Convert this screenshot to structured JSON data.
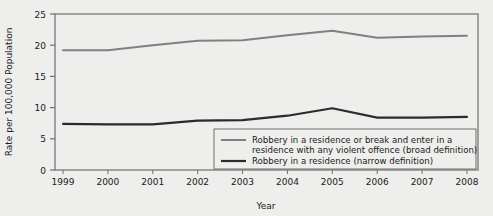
{
  "chart_data": {
    "type": "line",
    "title": "",
    "xlabel": "Year",
    "ylabel": "Rate per 100,000 Population",
    "categories": [
      "1999",
      "2000",
      "2001",
      "2002",
      "2003",
      "2004",
      "2005",
      "2006",
      "2007",
      "2008"
    ],
    "x": [
      1999,
      2000,
      2001,
      2002,
      2003,
      2004,
      2005,
      2006,
      2007,
      2008
    ],
    "xlim": [
      1999,
      2008
    ],
    "ylim": [
      0,
      25
    ],
    "yticks": [
      0,
      5,
      10,
      15,
      20,
      25
    ],
    "ytick_labels": [
      "0",
      "5",
      "10",
      "15",
      "20",
      "25"
    ],
    "grid": false,
    "legend_position": "lower right",
    "series": [
      {
        "name": "Robbery in a residence or break and enter in a residence with any violent offence (broad definition)",
        "color": "#808080",
        "values": [
          19.2,
          19.2,
          20.0,
          20.7,
          20.8,
          21.6,
          22.3,
          21.2,
          21.4,
          21.5
        ]
      },
      {
        "name": "Robbery in a residence (narrow definition)",
        "color": "#2b2b2b",
        "values": [
          7.4,
          7.3,
          7.3,
          7.9,
          8.0,
          8.7,
          9.9,
          8.4,
          8.4,
          8.5
        ]
      }
    ]
  },
  "legend": {
    "items": [
      {
        "line1": "Robbery in a residence or break and enter in a",
        "line2": "residence with any violent offence (broad definition)",
        "color": "#808080"
      },
      {
        "line1": "Robbery in a residence (narrow definition)",
        "line2": "",
        "color": "#2b2b2b"
      }
    ]
  },
  "colors": {
    "background": "#eeeeec",
    "axis": "#6f6f6f",
    "text": "#1a1a1a",
    "broad_series": "#808080",
    "narrow_series": "#2b2b2b"
  }
}
